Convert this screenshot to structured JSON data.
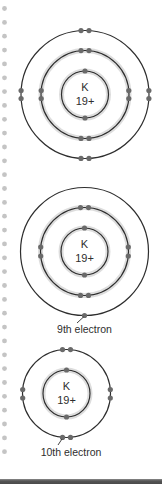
{
  "figure": {
    "colors": {
      "ring": "#2e2e2e",
      "ring_glow": "#d9d9d9",
      "electron": "#6a6a6a",
      "margin_dot": "#c4c4c4",
      "text": "#2e2e2e",
      "bottom_bar": "#555555"
    },
    "atoms": [
      {
        "id": "atom-1",
        "nucleus": {
          "symbol": "K",
          "charge": "19+"
        },
        "shells": [
          2,
          8,
          8
        ],
        "label": ""
      },
      {
        "id": "atom-2",
        "nucleus": {
          "symbol": "K",
          "charge": "19+"
        },
        "shells": [
          2,
          6,
          1
        ],
        "label": "9th electron"
      },
      {
        "id": "atom-3",
        "nucleus": {
          "symbol": "K",
          "charge": "19+"
        },
        "shells": [
          2,
          8
        ],
        "label": "10th electron"
      }
    ]
  }
}
